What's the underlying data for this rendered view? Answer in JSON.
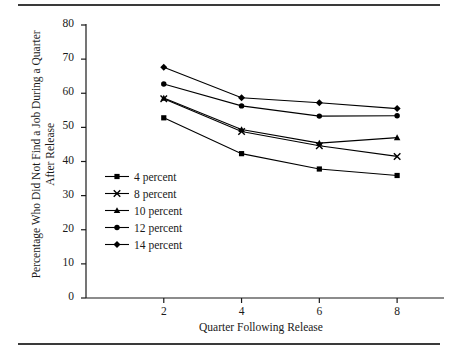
{
  "chart_data": {
    "type": "line",
    "title": "",
    "xlabel": "Quarter Following Release",
    "ylabel": "Percentage Who Did Not Find a Job During a Quarter After Release",
    "x": [
      2,
      4,
      6,
      8
    ],
    "xlim": [
      0,
      9
    ],
    "ylim": [
      0,
      80
    ],
    "xticks": [
      "2",
      "4",
      "6",
      "8"
    ],
    "yticks": [
      "0",
      "10",
      "20",
      "30",
      "40",
      "50",
      "60",
      "70",
      "80"
    ],
    "grid": false,
    "legend_position": "center-left",
    "series": [
      {
        "name": "4 percent",
        "marker": "square",
        "values": [
          52.8,
          42.3,
          37.8,
          35.9
        ]
      },
      {
        "name": "8 percent",
        "marker": "x",
        "values": [
          58.4,
          48.8,
          44.6,
          41.5
        ]
      },
      {
        "name": "10 percent",
        "marker": "triangle",
        "values": [
          58.6,
          49.4,
          45.4,
          47.0
        ]
      },
      {
        "name": "12 percent",
        "marker": "circle",
        "values": [
          62.7,
          56.3,
          53.3,
          53.4
        ]
      },
      {
        "name": "14 percent",
        "marker": "diamond",
        "values": [
          67.6,
          58.7,
          57.2,
          55.5
        ]
      }
    ]
  },
  "colors": {
    "line": "#000000",
    "axis": "#1a1a1a",
    "rule": "#3a3a3a",
    "background": "#ffffff"
  }
}
